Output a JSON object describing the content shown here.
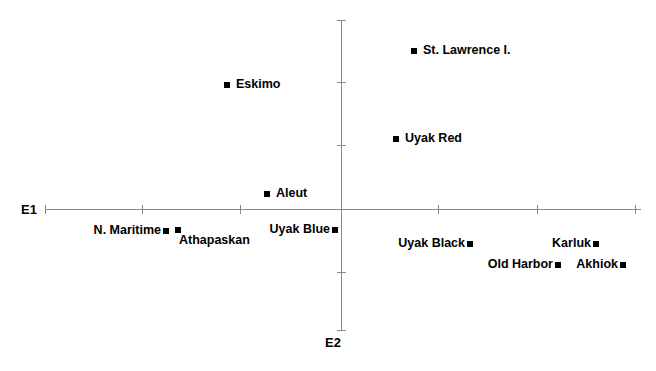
{
  "chart_data": {
    "type": "scatter",
    "title": "",
    "xlabel": "E1",
    "ylabel": "E2",
    "grid": false,
    "legend": "none",
    "axes": {
      "x_axis_label": "E1",
      "y_axis_label": "E2",
      "origin_px": {
        "x": 341,
        "y": 209
      },
      "x_axis_span_px": {
        "start": 45,
        "end": 641
      },
      "y_axis_span_px": {
        "start": 20,
        "end": 330
      },
      "x_tick_px": [
        45,
        142,
        240,
        438,
        537,
        635
      ],
      "y_tick_px": [
        20,
        82,
        145,
        272,
        330
      ],
      "x_tick_labels": [],
      "y_tick_labels": []
    },
    "points": [
      {
        "label": "St. Lawrence I.",
        "marker_px": {
          "x": 414,
          "y": 51
        },
        "label_px": {
          "x": 423,
          "y": 44
        },
        "label_side": "right"
      },
      {
        "label": "Eskimo",
        "marker_px": {
          "x": 227,
          "y": 85
        },
        "label_px": {
          "x": 236,
          "y": 78
        },
        "label_side": "right"
      },
      {
        "label": "Uyak Red",
        "marker_px": {
          "x": 396,
          "y": 139
        },
        "label_px": {
          "x": 405,
          "y": 132
        },
        "label_side": "right"
      },
      {
        "label": "Aleut",
        "marker_px": {
          "x": 267,
          "y": 194
        },
        "label_px": {
          "x": 276,
          "y": 187
        },
        "label_side": "right"
      },
      {
        "label": "N. Maritime",
        "marker_px": {
          "x": 166,
          "y": 231
        },
        "label_px": {
          "x": 161,
          "y": 224
        },
        "label_side": "left"
      },
      {
        "label": "Athapaskan",
        "marker_px": {
          "x": 178,
          "y": 230
        },
        "label_px": {
          "x": 179,
          "y": 234
        },
        "label_side": "right"
      },
      {
        "label": "Uyak Blue",
        "marker_px": {
          "x": 335,
          "y": 230
        },
        "label_px": {
          "x": 330,
          "y": 223
        },
        "label_side": "left"
      },
      {
        "label": "Uyak Black",
        "marker_px": {
          "x": 470,
          "y": 244
        },
        "label_px": {
          "x": 465,
          "y": 237
        },
        "label_side": "left"
      },
      {
        "label": "Karluk",
        "marker_px": {
          "x": 596,
          "y": 244
        },
        "label_px": {
          "x": 591,
          "y": 237
        },
        "label_side": "left"
      },
      {
        "label": "Old Harbor",
        "marker_px": {
          "x": 558,
          "y": 265
        },
        "label_px": {
          "x": 553,
          "y": 258
        },
        "label_side": "left"
      },
      {
        "label": "Akhiok",
        "marker_px": {
          "x": 623,
          "y": 265
        },
        "label_px": {
          "x": 618,
          "y": 258
        },
        "label_side": "left"
      }
    ]
  },
  "axis_labels": {
    "e1": "E1",
    "e2": "E2"
  },
  "colors": {
    "marker": "#000000",
    "axis": "#8a8a8a",
    "text": "#000000",
    "background": "#ffffff"
  }
}
